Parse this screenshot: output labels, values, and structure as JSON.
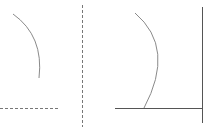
{
  "diagram": {
    "colors": {
      "stroke": "#8a8a8a",
      "axis": "#555555",
      "background": "#ffffff"
    },
    "panels": [
      {
        "name": "left",
        "elements": [
          "arc",
          "dashed-horizontal",
          "dashed-vertical"
        ]
      },
      {
        "name": "right",
        "elements": [
          "arc",
          "solid-horizontal",
          "solid-vertical"
        ]
      }
    ]
  }
}
